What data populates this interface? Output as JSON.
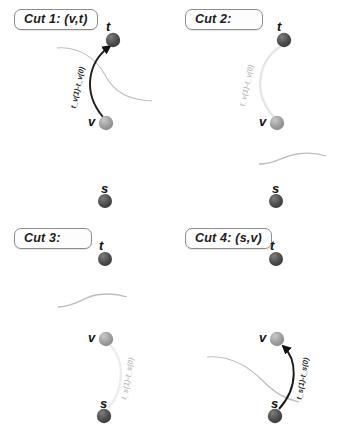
{
  "figure": {
    "width": 341,
    "height": 437,
    "background": "#ffffff",
    "node_colors": {
      "dark": "#4a4a4a",
      "light": "#9a9a9a",
      "darkest": "#3a3a3a"
    },
    "edge_colors": {
      "active": "#1a1a1a",
      "inactive": "#e8e8e8",
      "cut_line": "#b8b8b8"
    }
  },
  "panels": [
    {
      "id": "cut-1",
      "title": "Cut 1: (v,t)",
      "nodes": [
        {
          "name": "t",
          "label": "t",
          "shade": "dark",
          "cx": 113,
          "cy": 40
        },
        {
          "name": "v",
          "label": "v",
          "shade": "light",
          "cx": 106,
          "cy": 123
        },
        {
          "name": "s",
          "label": "s",
          "shade": "dark",
          "cx": 105,
          "cy": 201
        }
      ],
      "edge": {
        "from": "v",
        "to": "t",
        "state": "active",
        "label": "t_v(1)-t_v(0)",
        "arrow": true
      },
      "cut_separator": {
        "present": true,
        "position": "between-v-and-t"
      }
    },
    {
      "id": "cut-2",
      "title": "Cut 2:",
      "nodes": [
        {
          "name": "t",
          "label": "t",
          "shade": "dark",
          "cx": 113,
          "cy": 40
        },
        {
          "name": "v",
          "label": "v",
          "shade": "light",
          "cx": 106,
          "cy": 123
        },
        {
          "name": "s",
          "label": "s",
          "shade": "dark",
          "cx": 105,
          "cy": 201
        }
      ],
      "edge": {
        "from": "v",
        "to": "t",
        "state": "inactive",
        "label": "t_v(1)-t_v(0)",
        "arrow": false
      },
      "cut_separator": {
        "present": true,
        "position": "between-v-and-s"
      }
    },
    {
      "id": "cut-3",
      "title": "Cut 3:",
      "nodes": [
        {
          "name": "t",
          "label": "t",
          "shade": "dark",
          "cx": 105,
          "cy": 40
        },
        {
          "name": "v",
          "label": "v",
          "shade": "light",
          "cx": 106,
          "cy": 120
        },
        {
          "name": "s",
          "label": "s",
          "shade": "darkest",
          "cx": 104,
          "cy": 197
        }
      ],
      "edge": {
        "from": "s",
        "to": "v",
        "state": "inactive",
        "label": "t_s(1)-t_s(0)",
        "arrow": false
      },
      "cut_separator": {
        "present": true,
        "position": "between-t-and-v"
      }
    },
    {
      "id": "cut-4",
      "title": "Cut 4: (s,v)",
      "nodes": [
        {
          "name": "t",
          "label": "t",
          "shade": "dark",
          "cx": 105,
          "cy": 40
        },
        {
          "name": "v",
          "label": "v",
          "shade": "light",
          "cx": 106,
          "cy": 120
        },
        {
          "name": "s",
          "label": "s",
          "shade": "darkest",
          "cx": 104,
          "cy": 197
        }
      ],
      "edge": {
        "from": "s",
        "to": "v",
        "state": "active",
        "label": "t_s(1)-t_s(0)",
        "arrow": true
      },
      "cut_separator": {
        "present": true,
        "position": "between-v-and-s"
      }
    }
  ]
}
